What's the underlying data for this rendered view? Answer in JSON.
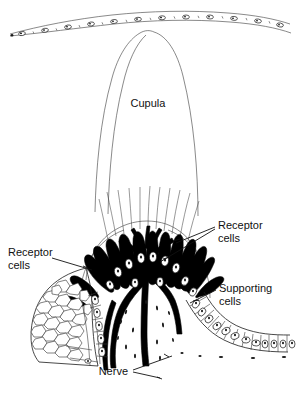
{
  "figure": {
    "background_color": "#ffffff",
    "ink_color": "#1a1a1a",
    "width": 296,
    "height": 397
  },
  "labels": {
    "cupula": "Cupula",
    "receptor_cells_right": "Receptor\ncells",
    "receptor_cells_right_line1": "Receptor",
    "receptor_cells_right_line2": "cells",
    "receptor_cells_left_line1": "Receptor",
    "receptor_cells_left_line2": "cells",
    "supporting_cells_line1": "Supporting",
    "supporting_cells_line2": "cells",
    "nerve": "Nerve"
  },
  "structures": {
    "cupula_name": "cupula",
    "epithelium_name": "epithelial-band",
    "receptor_cell_count": 14,
    "nerve_branch_name": "nerve-tree",
    "supporting_cell_name": "supporting-cell",
    "honeycomb_name": "honeycomb-tissue"
  }
}
